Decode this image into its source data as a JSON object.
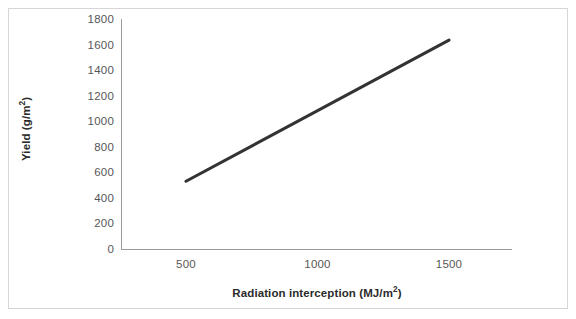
{
  "chart_data": {
    "type": "line",
    "title": "",
    "xlabel": "Radiation interception (MJ/m²)",
    "ylabel": "Yield (g/m²)",
    "xlim": [
      380,
      1880
    ],
    "ylim": [
      0,
      1800
    ],
    "grid": false,
    "legend": "none",
    "x_ticks": [
      "500",
      "1000",
      "1500"
    ],
    "x_tick_values": [
      500,
      1000,
      1500
    ],
    "y_ticks": [
      "0",
      "200",
      "400",
      "600",
      "800",
      "1000",
      "1200",
      "1400",
      "1600",
      "1800"
    ],
    "y_tick_values": [
      0,
      200,
      400,
      600,
      800,
      1000,
      1200,
      1400,
      1600,
      1800
    ],
    "series": [
      {
        "name": "Yield vs radiation interception",
        "color": "#333333",
        "line_width": 3,
        "x": [
          500,
          1500
        ],
        "values": [
          530,
          1635
        ]
      }
    ]
  },
  "axes": {
    "x_title": "Radiation interception (MJ/m²)",
    "y_title": "Yield (g/m²)",
    "axis_color": "#9a9a9a",
    "tick_label_color": "#575757",
    "title_color": "#2b2b2b"
  },
  "figure": {
    "background": "#ffffff",
    "border_color": "#d6d6d6"
  }
}
